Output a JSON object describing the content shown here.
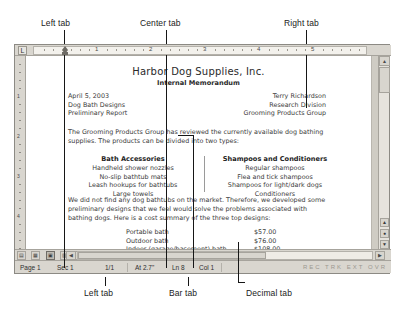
{
  "annotations": {
    "top": [
      {
        "label": "Left tab",
        "name": "annotation-left-tab-top"
      },
      {
        "label": "Center tab",
        "name": "annotation-center-tab"
      },
      {
        "label": "Right tab",
        "name": "annotation-right-tab"
      }
    ],
    "bottom": [
      {
        "label": "Left tab",
        "name": "annotation-left-tab-bottom"
      },
      {
        "label": "Bar tab",
        "name": "annotation-bar-tab"
      },
      {
        "label": "Decimal tab",
        "name": "annotation-decimal-tab"
      }
    ]
  },
  "ruler": {
    "tab_selector_glyph": "L",
    "numbers": [
      "1",
      "2",
      "3",
      "4",
      "5"
    ]
  },
  "document": {
    "title": "Harbor Dog Supplies, Inc.",
    "subtitle": "Internal Memorandum",
    "left_block": [
      "April 5, 2003",
      "Dog Bath Designs",
      "Preliminary Report"
    ],
    "right_block": [
      "Terry Richardson",
      "Research Division",
      "Grooming Products Group"
    ],
    "paragraph_1": "The Grooming Products Group has reviewed the currently available dog bathing supplies.  The products can be divided into two types:",
    "columns": [
      {
        "heading": "Bath Accessories",
        "items": [
          "Handheld shower nozzles",
          "No-slip bathtub mats",
          "Leash hookups for bathtubs",
          "Large towels"
        ]
      },
      {
        "heading": "Shampoos and Conditioners",
        "items": [
          "Regular shampoos",
          "Flea and tick shampoos",
          "Shampoos for light/dark dogs",
          "Conditioners"
        ]
      }
    ],
    "paragraph_2": "We did not find any dog bathtubs on the market.  Therefore, we developed some preliminary designs that we feel would solve the problems associated with bathing dogs.  Here is a cost summary of the three top designs:",
    "costs": [
      {
        "name": "Portable bath",
        "value": "$57.00"
      },
      {
        "name": "Outdoor bath",
        "value": "$76.00"
      },
      {
        "name": "Indoor (garage/basement) bath",
        "value": "$108.00"
      }
    ]
  },
  "statusbar": {
    "page": "Page 1",
    "section": "Sec 1",
    "pages": "1/1",
    "at": "At 2.7\"",
    "line": "Ln 8",
    "column": "Col 1",
    "modes": "REC TRK EXT OVR"
  },
  "viewbuttons": [
    {
      "name": "view-normal",
      "glyph": "▤"
    },
    {
      "name": "view-web",
      "glyph": "▦"
    },
    {
      "name": "view-print",
      "glyph": "▣"
    },
    {
      "name": "view-outline",
      "glyph": "▥"
    },
    {
      "name": "view-reading",
      "glyph": "◎"
    }
  ],
  "scrollbar": {
    "up_glyph": "▲",
    "down_glyph": "▼",
    "left_glyph": "◀",
    "right_glyph": "▶",
    "prev_page_glyph": "▲",
    "select_browse_glyph": "●",
    "next_page_glyph": "▼"
  }
}
